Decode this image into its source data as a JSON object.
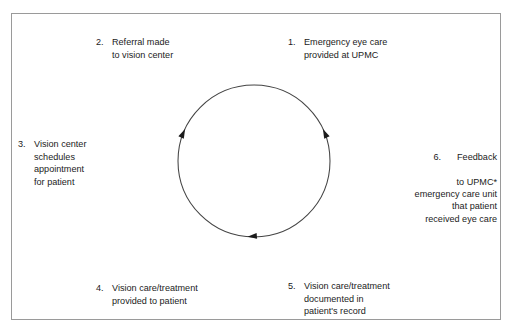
{
  "figure": {
    "clipped_top_text": "",
    "border_color": "#9a9a9a",
    "background_color": "#ffffff",
    "text_color": "#1b1b1b"
  },
  "diagram": {
    "type": "circular-process-flow",
    "direction": "clockwise",
    "circle": {
      "center_x": 254,
      "center_y": 161,
      "radius": 76,
      "stroke_color": "#444444"
    },
    "arrowheads": [
      {
        "name": "arrowhead-left",
        "angle_deg": 205,
        "direction": "clockwise"
      },
      {
        "name": "arrowhead-right",
        "angle_deg": 25,
        "direction": "clockwise"
      },
      {
        "name": "arrowhead-bottom",
        "angle_deg": 95,
        "direction": "clockwise"
      }
    ],
    "steps": [
      {
        "number": "1.",
        "text": "Emergency eye care\nprovided at UPMC",
        "position": "upper-right",
        "align": "left"
      },
      {
        "number": "2.",
        "text": "Referral made\nto vision center",
        "position": "upper-left",
        "align": "left"
      },
      {
        "number": "3.",
        "text": "Vision center\nschedules\nappointment\nfor patient",
        "position": "left",
        "align": "left"
      },
      {
        "number": "4.",
        "text": "Vision care/treatment\nprovided to patient",
        "position": "lower-left",
        "align": "left"
      },
      {
        "number": "5.",
        "text": "Vision care/treatment\ndocumented in\npatient's record",
        "position": "lower-right",
        "align": "left"
      },
      {
        "number": "6.",
        "head": "Feedback",
        "text": "to UPMC*\nemergency care unit\nthat  patient\nreceived eye care",
        "position": "right",
        "align": "right"
      }
    ]
  }
}
